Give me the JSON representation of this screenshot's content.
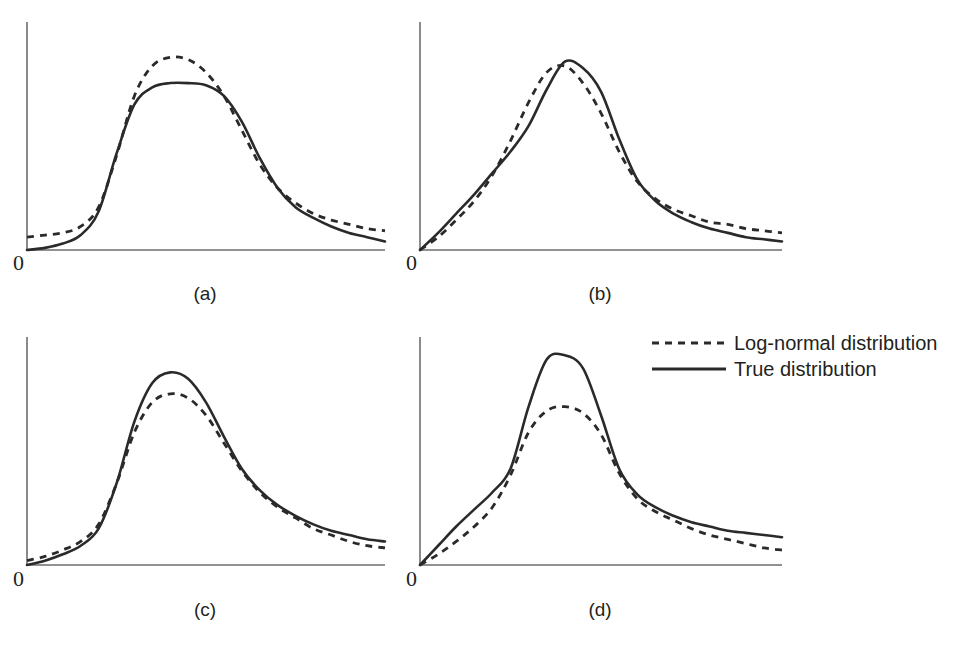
{
  "figure": {
    "background_color": "#ffffff",
    "line_color": "#2a2a2a",
    "axis_color": "#6e6e6e"
  },
  "panels": [
    {
      "id": "a",
      "caption": "(a)",
      "origin_label": "0",
      "caption_x": 205,
      "caption_y": 283,
      "zero_x": 13,
      "zero_y": 252
    },
    {
      "id": "b",
      "caption": "(b)",
      "origin_label": "0",
      "caption_x": 600,
      "caption_y": 283,
      "zero_x": 406,
      "zero_y": 252
    },
    {
      "id": "c",
      "caption": "(c)",
      "origin_label": "0",
      "caption_x": 205,
      "caption_y": 599,
      "zero_x": 13,
      "zero_y": 568
    },
    {
      "id": "d",
      "caption": "(d)",
      "origin_label": "0",
      "caption_x": 600,
      "caption_y": 599,
      "zero_x": 406,
      "zero_y": 568
    }
  ],
  "legend": {
    "items": [
      {
        "label": "Log-normal distribution",
        "style": "dashed"
      },
      {
        "label": "True distribution",
        "style": "solid"
      }
    ]
  },
  "chart_data": {
    "type": "line",
    "title": "",
    "xlabel": "",
    "ylabel": "",
    "grid": false,
    "legend_position": "middle-right",
    "legend_entries": [
      "Log-normal distribution",
      "True distribution"
    ],
    "axis_tick_labels": [
      "0"
    ],
    "panels": [
      {
        "id": "a",
        "caption": "(a)",
        "description": "Broad, nearly symmetric plateau-topped true distribution; log-normal fit peaks higher and narrower at the mode, true curve has flat top; tails nearly coincide with log-normal slightly above at far right",
        "axis": {
          "x_origin": 27,
          "x_end": 385,
          "y_top": 22,
          "y_baseline": 250
        },
        "series": [
          {
            "name": "True distribution",
            "style": "solid",
            "x": [
              0,
              0.05,
              0.1,
              0.15,
              0.2,
              0.25,
              0.3,
              0.35,
              0.4,
              0.45,
              0.5,
              0.55,
              0.6,
              0.65,
              0.7,
              0.75,
              0.8,
              0.85,
              0.9,
              0.95,
              1.0
            ],
            "y": [
              0.0,
              0.01,
              0.03,
              0.07,
              0.18,
              0.45,
              0.68,
              0.76,
              0.78,
              0.78,
              0.77,
              0.72,
              0.6,
              0.43,
              0.29,
              0.2,
              0.15,
              0.11,
              0.08,
              0.06,
              0.04
            ]
          },
          {
            "name": "Log-normal distribution",
            "style": "dashed",
            "x": [
              0,
              0.05,
              0.1,
              0.15,
              0.2,
              0.25,
              0.3,
              0.35,
              0.4,
              0.45,
              0.5,
              0.55,
              0.6,
              0.65,
              0.7,
              0.75,
              0.8,
              0.85,
              0.9,
              0.95,
              1.0
            ],
            "y": [
              0.06,
              0.07,
              0.08,
              0.11,
              0.2,
              0.44,
              0.72,
              0.86,
              0.9,
              0.89,
              0.83,
              0.72,
              0.56,
              0.4,
              0.29,
              0.22,
              0.17,
              0.14,
              0.12,
              0.1,
              0.09
            ]
          }
        ]
      },
      {
        "id": "b",
        "caption": "(b)",
        "description": "Right-skewed unimodal curves; log-normal rises faster on the left shoulder, true curve peaks slightly higher and slightly to the right; log-normal tail sits above the true tail on the right",
        "axis": {
          "x_origin": 420,
          "x_end": 782,
          "y_top": 22,
          "y_baseline": 250
        },
        "series": [
          {
            "name": "True distribution",
            "style": "solid",
            "x": [
              0,
              0.05,
              0.1,
              0.15,
              0.2,
              0.25,
              0.3,
              0.35,
              0.4,
              0.45,
              0.5,
              0.55,
              0.6,
              0.65,
              0.7,
              0.75,
              0.8,
              0.85,
              0.9,
              0.95,
              1.0
            ],
            "y": [
              0.0,
              0.08,
              0.17,
              0.26,
              0.36,
              0.46,
              0.58,
              0.75,
              0.88,
              0.85,
              0.74,
              0.52,
              0.33,
              0.23,
              0.17,
              0.13,
              0.1,
              0.08,
              0.06,
              0.05,
              0.04
            ]
          },
          {
            "name": "Log-normal distribution",
            "style": "dashed",
            "x": [
              0,
              0.05,
              0.1,
              0.15,
              0.2,
              0.25,
              0.3,
              0.35,
              0.4,
              0.45,
              0.5,
              0.55,
              0.6,
              0.65,
              0.7,
              0.75,
              0.8,
              0.85,
              0.9,
              0.95,
              1.0
            ],
            "y": [
              0.0,
              0.06,
              0.14,
              0.23,
              0.35,
              0.51,
              0.69,
              0.83,
              0.86,
              0.78,
              0.64,
              0.46,
              0.32,
              0.24,
              0.19,
              0.16,
              0.13,
              0.12,
              0.1,
              0.09,
              0.08
            ]
          }
        ]
      },
      {
        "id": "c",
        "caption": "(c)",
        "description": "Right-skewed unimodal curves with nearly identical shape; true curve peaks higher than the log-normal fit at the mode and runs slightly above it in the far right tail",
        "axis": {
          "x_origin": 27,
          "x_end": 385,
          "y_top": 337,
          "y_baseline": 565
        },
        "series": [
          {
            "name": "True distribution",
            "style": "solid",
            "x": [
              0,
              0.05,
              0.1,
              0.15,
              0.2,
              0.25,
              0.3,
              0.35,
              0.4,
              0.45,
              0.5,
              0.55,
              0.6,
              0.65,
              0.7,
              0.75,
              0.8,
              0.85,
              0.9,
              0.95,
              1.0
            ],
            "y": [
              0.0,
              0.02,
              0.05,
              0.09,
              0.17,
              0.38,
              0.67,
              0.85,
              0.9,
              0.87,
              0.76,
              0.6,
              0.45,
              0.35,
              0.28,
              0.23,
              0.19,
              0.16,
              0.14,
              0.12,
              0.11
            ]
          },
          {
            "name": "Log-normal distribution",
            "style": "dashed",
            "x": [
              0,
              0.05,
              0.1,
              0.15,
              0.2,
              0.25,
              0.3,
              0.35,
              0.4,
              0.45,
              0.5,
              0.55,
              0.6,
              0.65,
              0.7,
              0.75,
              0.8,
              0.85,
              0.9,
              0.95,
              1.0
            ],
            "y": [
              0.02,
              0.04,
              0.07,
              0.11,
              0.19,
              0.38,
              0.62,
              0.76,
              0.8,
              0.78,
              0.7,
              0.57,
              0.44,
              0.34,
              0.27,
              0.22,
              0.17,
              0.14,
              0.11,
              0.09,
              0.08
            ]
          }
        ]
      },
      {
        "id": "d",
        "caption": "(d)",
        "description": "True distribution is much more sharply peaked than the log-normal fit; true curve rises steeply, overshoots the mode, and stays above the log-normal across the whole right tail",
        "axis": {
          "x_origin": 420,
          "x_end": 782,
          "y_top": 337,
          "y_baseline": 565
        },
        "series": [
          {
            "name": "True distribution",
            "style": "solid",
            "x": [
              0,
              0.05,
              0.1,
              0.15,
              0.2,
              0.25,
              0.3,
              0.35,
              0.4,
              0.45,
              0.5,
              0.55,
              0.6,
              0.65,
              0.7,
              0.75,
              0.8,
              0.85,
              0.9,
              0.95,
              1.0
            ],
            "y": [
              0.0,
              0.09,
              0.18,
              0.26,
              0.34,
              0.45,
              0.74,
              0.96,
              0.98,
              0.92,
              0.7,
              0.45,
              0.33,
              0.27,
              0.23,
              0.2,
              0.18,
              0.16,
              0.15,
              0.14,
              0.13
            ]
          },
          {
            "name": "Log-normal distribution",
            "style": "dashed",
            "x": [
              0,
              0.05,
              0.1,
              0.15,
              0.2,
              0.25,
              0.3,
              0.35,
              0.4,
              0.45,
              0.5,
              0.55,
              0.6,
              0.65,
              0.7,
              0.75,
              0.8,
              0.85,
              0.9,
              0.95,
              1.0
            ],
            "y": [
              0.0,
              0.05,
              0.11,
              0.18,
              0.27,
              0.42,
              0.62,
              0.72,
              0.74,
              0.71,
              0.61,
              0.43,
              0.31,
              0.25,
              0.21,
              0.17,
              0.14,
              0.12,
              0.1,
              0.08,
              0.07
            ]
          }
        ]
      }
    ]
  }
}
